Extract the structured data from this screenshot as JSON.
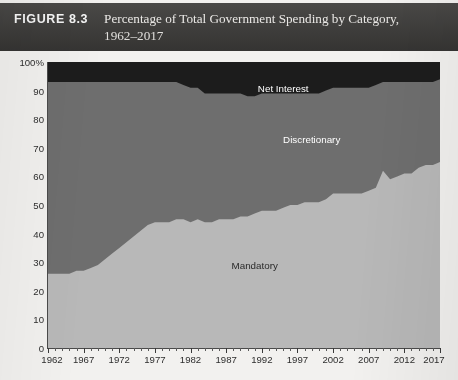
{
  "header": {
    "figure_label": "FIGURE 8.3",
    "title_line1": "Percentage of Total Government Spending by Category,",
    "title_line2": "1962–2017",
    "bar_color": "#3c3b39"
  },
  "series_labels": {
    "net_interest": "Net Interest",
    "discretionary": "Discretionary",
    "mandatory": "Mandatory"
  },
  "chart_data": {
    "type": "area",
    "stacked": true,
    "title": "Percentage of Total Government Spending by Category, 1962–2017",
    "xlabel": "",
    "ylabel": "",
    "ylim": [
      0,
      100
    ],
    "xlim": [
      1962,
      2017
    ],
    "grid": false,
    "legend_position": "inline-annotations",
    "y_ticks": [
      0,
      10,
      20,
      30,
      40,
      50,
      60,
      70,
      80,
      90,
      100
    ],
    "y_tick_labels": [
      "0",
      "10",
      "20",
      "30",
      "40",
      "50",
      "60",
      "70",
      "80",
      "90",
      "100%"
    ],
    "x_ticks": [
      1962,
      1967,
      1972,
      1977,
      1982,
      1987,
      1992,
      1997,
      2002,
      2007,
      2012,
      2017
    ],
    "x_tick_labels": [
      "1962",
      "1967",
      "1972",
      "1977",
      "1982",
      "1987",
      "1992",
      "1997",
      "2002",
      "2007",
      "2012",
      "2017"
    ],
    "x_minor_tick_interval": 1,
    "colors": {
      "mandatory": "#b8b8b8",
      "discretionary": "#6e6e6e",
      "net_interest": "#1c1c1c",
      "plot_background": "#b8b8b8",
      "page_background": "#f2f1ef",
      "axis": "#4a4a4a"
    },
    "x": [
      1962,
      1963,
      1964,
      1965,
      1966,
      1967,
      1968,
      1969,
      1970,
      1971,
      1972,
      1973,
      1974,
      1975,
      1976,
      1977,
      1978,
      1979,
      1980,
      1981,
      1982,
      1983,
      1984,
      1985,
      1986,
      1987,
      1988,
      1989,
      1990,
      1991,
      1992,
      1993,
      1994,
      1995,
      1996,
      1997,
      1998,
      1999,
      2000,
      2001,
      2002,
      2003,
      2004,
      2005,
      2006,
      2007,
      2008,
      2009,
      2010,
      2011,
      2012,
      2013,
      2014,
      2015,
      2016,
      2017
    ],
    "series": [
      {
        "name": "Mandatory",
        "color": "#b8b8b8",
        "values": [
          26,
          26,
          26,
          26,
          27,
          27,
          28,
          29,
          31,
          33,
          35,
          37,
          39,
          41,
          43,
          44,
          44,
          44,
          45,
          45,
          44,
          45,
          44,
          44,
          45,
          45,
          45,
          46,
          46,
          47,
          48,
          48,
          48,
          49,
          50,
          50,
          51,
          51,
          51,
          52,
          54,
          54,
          54,
          54,
          54,
          55,
          56,
          62,
          59,
          60,
          61,
          61,
          63,
          64,
          64,
          65
        ]
      },
      {
        "name": "Discretionary",
        "color": "#6e6e6e",
        "values": [
          67,
          67,
          67,
          67,
          66,
          66,
          65,
          64,
          62,
          60,
          58,
          56,
          54,
          52,
          50,
          49,
          49,
          49,
          48,
          47,
          47,
          46,
          45,
          45,
          44,
          44,
          44,
          43,
          42,
          41,
          41,
          41,
          41,
          40,
          39,
          39,
          38,
          38,
          38,
          38,
          37,
          37,
          37,
          37,
          37,
          36,
          36,
          31,
          34,
          33,
          32,
          32,
          30,
          29,
          29,
          29
        ]
      },
      {
        "name": "Net Interest",
        "color": "#1c1c1c",
        "values": [
          7,
          7,
          7,
          7,
          7,
          7,
          7,
          7,
          7,
          7,
          7,
          7,
          7,
          7,
          7,
          7,
          7,
          7,
          7,
          8,
          9,
          9,
          11,
          11,
          11,
          11,
          11,
          11,
          12,
          12,
          11,
          11,
          11,
          11,
          11,
          11,
          11,
          11,
          11,
          10,
          9,
          9,
          9,
          9,
          9,
          9,
          8,
          7,
          7,
          7,
          7,
          7,
          7,
          7,
          7,
          6
        ]
      }
    ],
    "boundaries": {
      "mandatory_top": [
        26,
        26,
        26,
        26,
        27,
        27,
        28,
        29,
        31,
        33,
        35,
        37,
        39,
        41,
        43,
        44,
        44,
        44,
        45,
        45,
        44,
        45,
        44,
        44,
        45,
        45,
        45,
        46,
        46,
        47,
        48,
        48,
        48,
        49,
        50,
        50,
        51,
        51,
        51,
        52,
        54,
        54,
        54,
        54,
        54,
        55,
        56,
        62,
        59,
        60,
        61,
        61,
        63,
        64,
        64,
        65
      ],
      "discretionary_top": [
        93,
        93,
        93,
        93,
        93,
        93,
        93,
        93,
        93,
        93,
        93,
        93,
        93,
        93,
        93,
        93,
        93,
        93,
        93,
        92,
        91,
        91,
        89,
        89,
        89,
        89,
        89,
        89,
        88,
        88,
        89,
        89,
        89,
        89,
        89,
        89,
        89,
        89,
        89,
        90,
        91,
        91,
        91,
        91,
        91,
        91,
        92,
        93,
        93,
        93,
        93,
        93,
        93,
        93,
        93,
        94
      ]
    },
    "annotations": [
      {
        "text": "Net Interest",
        "x": 1995,
        "y": 91,
        "color": "#ffffff"
      },
      {
        "text": "Discretionary",
        "x": 1999,
        "y": 73,
        "color": "#ffffff"
      },
      {
        "text": "Mandatory",
        "x": 1991,
        "y": 29,
        "color": "#2a2a2a"
      }
    ]
  }
}
